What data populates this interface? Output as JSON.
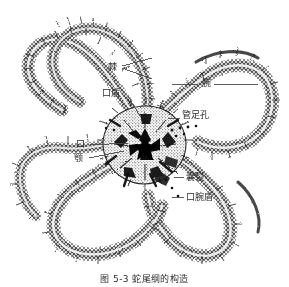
{
  "figure": {
    "domain": "Diagram",
    "caption": "图 5-3 蛇尾纲的构造",
    "background_color": "#ffffff",
    "ink_color": "#1a1a1a",
    "label_color": "#2b2b2b",
    "leader_color": "#4a4a4a"
  },
  "labels": [
    {
      "id": "spine",
      "text": "棘",
      "x": 108,
      "y": 62,
      "leaders": [
        {
          "x1": 122,
          "y1": 66,
          "x2": 152,
          "y2": 58
        },
        {
          "x1": 122,
          "y1": 68,
          "x2": 152,
          "y2": 79
        }
      ]
    },
    {
      "id": "oral-shield",
      "text": "口盾",
      "x": 102,
      "y": 88,
      "leaders": [
        {
          "x1": 128,
          "y1": 96,
          "x2": 140,
          "y2": 116
        }
      ]
    },
    {
      "id": "arm",
      "text": "腕",
      "x": 202,
      "y": 78,
      "leaders": [
        {
          "x1": 172,
          "y1": 84,
          "x2": 198,
          "y2": 84
        },
        {
          "x1": 214,
          "y1": 84,
          "x2": 258,
          "y2": 84
        }
      ]
    },
    {
      "id": "tube-foot-pore",
      "text": "管足孔",
      "x": 182,
      "y": 110,
      "leaders": [
        {
          "x1": 168,
          "y1": 118,
          "x2": 180,
          "y2": 118
        }
      ]
    },
    {
      "id": "mouth",
      "text": "口",
      "x": 76,
      "y": 139,
      "leaders": [
        {
          "x1": 90,
          "y1": 145,
          "x2": 128,
          "y2": 143
        }
      ]
    },
    {
      "id": "jaw",
      "text": "颚",
      "x": 74,
      "y": 153,
      "leaders": [
        {
          "x1": 89,
          "y1": 158,
          "x2": 124,
          "y2": 151
        }
      ]
    },
    {
      "id": "bursal-slit",
      "text": "囊裂",
      "x": 186,
      "y": 172,
      "leaders": [
        {
          "x1": 174,
          "y1": 177,
          "x2": 184,
          "y2": 177
        }
      ]
    },
    {
      "id": "adoral-shield",
      "text": "口腕盾",
      "x": 186,
      "y": 192,
      "leaders": [
        {
          "x1": 172,
          "y1": 197,
          "x2": 184,
          "y2": 197
        }
      ]
    }
  ],
  "caption_position": {
    "top": 272
  }
}
